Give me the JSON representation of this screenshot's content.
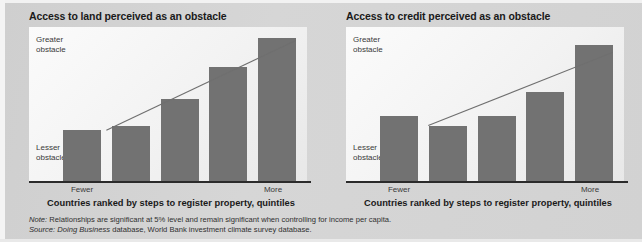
{
  "figure": {
    "background_color": "#d3d3d3",
    "bar_color": "#727272",
    "trend_color": "#6f6f6f",
    "axis_color": "#2b2b2b"
  },
  "panels": [
    {
      "id": "land",
      "title": "Access to land perceived as an obstacle",
      "y_axis_top_label": "Greater\nobstacle",
      "y_axis_bottom_label": "Lesser\nobstacle",
      "x_tick_left": "Fewer",
      "x_tick_right": "More",
      "x_axis_title": "Countries ranked by steps to register property, quintiles"
    },
    {
      "id": "credit",
      "title": "Access to credit perceived as an obstacle",
      "y_axis_top_label": "Greater\nobstacle",
      "y_axis_bottom_label": "Lesser\nobstacle",
      "x_tick_left": "Fewer",
      "x_tick_right": "More",
      "x_axis_title": "Countries ranked by steps to register property, quintiles"
    }
  ],
  "footnotes": {
    "note_label": "Note:",
    "note_text": " Relationships are significant at 5% level and remain significant when controlling for income per capita.",
    "source_label": "Source:",
    "source_italic": " Doing Business",
    "source_text": " database, World Bank investment climate survey database."
  },
  "chart_data": [
    {
      "type": "bar",
      "title": "Access to land perceived as an obstacle",
      "xlabel": "Countries ranked by steps to register property, quintiles",
      "ylabel": "Perceived obstacle (Lesser obstacle to Greater obstacle)",
      "categories": [
        "1 (Fewer)",
        "2",
        "3",
        "4",
        "5 (More)"
      ],
      "values": [
        33,
        36,
        53,
        74,
        93
      ],
      "ylim": [
        0,
        100
      ],
      "xtick_labels": [
        "Fewer",
        "",
        "",
        "",
        "More"
      ],
      "ytick_labels": [
        "Lesser obstacle",
        "Greater obstacle"
      ],
      "grid": false,
      "legend": "none",
      "annotations": [
        "upward linear trend line overlaid across the five bars"
      ],
      "trend_line": {
        "x_start": 0.5,
        "y_start": 33,
        "x_end": 4.5,
        "y_end": 93
      }
    },
    {
      "type": "bar",
      "title": "Access to credit perceived as an obstacle",
      "xlabel": "Countries ranked by steps to register property, quintiles",
      "ylabel": "Perceived obstacle (Lesser obstacle to Greater obstacle)",
      "categories": [
        "1 (Fewer)",
        "2",
        "3",
        "4",
        "5 (More)"
      ],
      "values": [
        42,
        36,
        42,
        58,
        88
      ],
      "ylim": [
        0,
        100
      ],
      "xtick_labels": [
        "Fewer",
        "",
        "",
        "",
        "More"
      ],
      "ytick_labels": [
        "Lesser obstacle",
        "Greater obstacle"
      ],
      "grid": false,
      "legend": "none",
      "annotations": [
        "upward linear trend line overlaid across the five bars"
      ],
      "trend_line": {
        "x_start": 0.6,
        "y_start": 36,
        "x_end": 4.5,
        "y_end": 85
      }
    }
  ]
}
